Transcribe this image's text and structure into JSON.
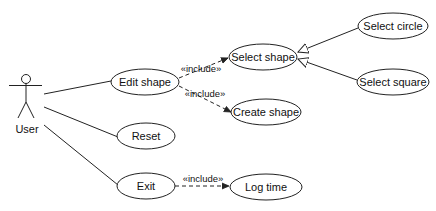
{
  "diagram": {
    "type": "UML use case diagram",
    "actor": {
      "label": "User",
      "x": 26,
      "y": 79
    },
    "use_cases": [
      {
        "id": "edit_shape",
        "label": "Edit shape",
        "cx": 145,
        "cy": 82,
        "rx": 34,
        "ry": 13
      },
      {
        "id": "select_shape",
        "label": "Select shape",
        "cx": 263,
        "cy": 57,
        "rx": 34,
        "ry": 13
      },
      {
        "id": "select_circle",
        "label": "Select circle",
        "cx": 393,
        "cy": 26,
        "rx": 35,
        "ry": 13
      },
      {
        "id": "select_square",
        "label": "Select square",
        "cx": 393,
        "cy": 82,
        "rx": 36,
        "ry": 13
      },
      {
        "id": "create_shape",
        "label": "Create shape",
        "cx": 266,
        "cy": 112,
        "rx": 35,
        "ry": 13
      },
      {
        "id": "reset",
        "label": "Reset",
        "cx": 146,
        "cy": 136,
        "rx": 29,
        "ry": 13
      },
      {
        "id": "exit",
        "label": "Exit",
        "cx": 146,
        "cy": 186,
        "rx": 29,
        "ry": 13
      },
      {
        "id": "log_time",
        "label": "Log time",
        "cx": 266,
        "cy": 187,
        "rx": 36,
        "ry": 13
      }
    ],
    "associations": [
      {
        "from": "User",
        "to": "Edit shape"
      },
      {
        "from": "User",
        "to": "Reset"
      },
      {
        "from": "User",
        "to": "Exit"
      }
    ],
    "includes": [
      {
        "from": "Edit shape",
        "to": "Select shape",
        "label": "«include»"
      },
      {
        "from": "Edit shape",
        "to": "Create shape",
        "label": "«include»"
      },
      {
        "from": "Exit",
        "to": "Log time",
        "label": "«include»"
      }
    ],
    "generalizations": [
      {
        "child": "Select circle",
        "parent": "Select shape"
      },
      {
        "child": "Select square",
        "parent": "Select shape"
      }
    ],
    "colors": {
      "stroke": "#222222",
      "background": "#ffffff"
    }
  }
}
